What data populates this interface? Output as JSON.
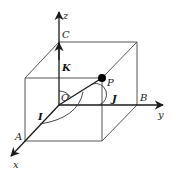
{
  "diagram": {
    "colors": {
      "edge": "#555555",
      "axis": "#1a1a1a",
      "point": "#000000",
      "background": "#ffffff"
    },
    "axes": {
      "x": {
        "label": "x"
      },
      "y": {
        "label": "y"
      },
      "z": {
        "label": "z"
      }
    },
    "points": {
      "origin": {
        "label": "O"
      },
      "a": {
        "label": "A"
      },
      "b": {
        "label": "B"
      },
      "c": {
        "label": "C"
      },
      "p": {
        "label": "P"
      }
    },
    "unit_vectors": {
      "i": {
        "label": "I"
      },
      "j": {
        "label": "J"
      },
      "k": {
        "label": "K"
      }
    }
  }
}
